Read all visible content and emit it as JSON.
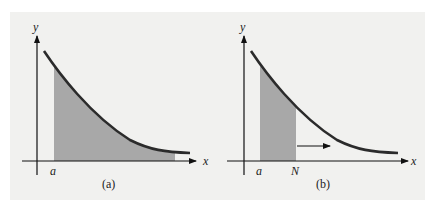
{
  "figure": {
    "panels": [
      {
        "id": "a",
        "caption": "(a)",
        "y_label": "y",
        "x_label": "x",
        "tick_labels": [
          "a"
        ],
        "shaded_region": "from a to end of curve (area under curve, unbounded)"
      },
      {
        "id": "b",
        "caption": "(b)",
        "y_label": "y",
        "x_label": "x",
        "tick_labels": [
          "a",
          "N"
        ],
        "shaded_region": "from a to N",
        "arrow": "N moves right"
      }
    ],
    "colors": {
      "background": "#f1f1ef",
      "curve": "#2b2b2b",
      "shade": "#a8a8a8",
      "axis": "#111111"
    }
  }
}
